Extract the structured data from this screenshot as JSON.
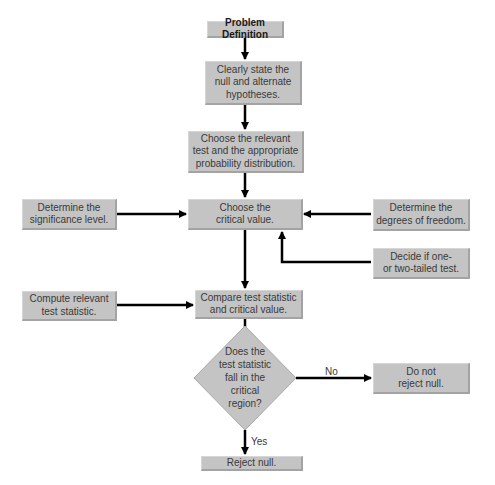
{
  "diagram": {
    "type": "flowchart",
    "nodes": {
      "problem_definition": "Problem Definition",
      "state_hypotheses": "Clearly state the\nnull and alternate\nhypotheses.",
      "choose_test": "Choose the relevant\ntest and the appropriate\nprobability distribution.",
      "choose_critical": "Choose the\ncritical value.",
      "significance_level": "Determine the\nsignificance level.",
      "degrees_freedom": "Determine the\ndegrees of freedom.",
      "tails": "Decide if one-\nor two-tailed test.",
      "compute_statistic": "Compute relevant\ntest statistic.",
      "compare": "Compare test statistic\nand critical value.",
      "decision": "Does the\ntest statistic\nfall in the\ncritical\nregion?",
      "reject": "Reject null.",
      "do_not_reject": "Do not\nreject null."
    },
    "edge_labels": {
      "no": "No",
      "yes": "Yes"
    },
    "colors": {
      "box_fill": "#c4c4c4",
      "arrow": "#000000",
      "text": "#3a3a3a"
    }
  }
}
